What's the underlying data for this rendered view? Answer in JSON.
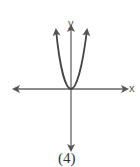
{
  "figure": {
    "caption": "(4)",
    "x_axis_label": "x",
    "y_axis_label": "y",
    "curve": "parabola opening upward, vertex at origin",
    "stroke_color": "#555555"
  }
}
